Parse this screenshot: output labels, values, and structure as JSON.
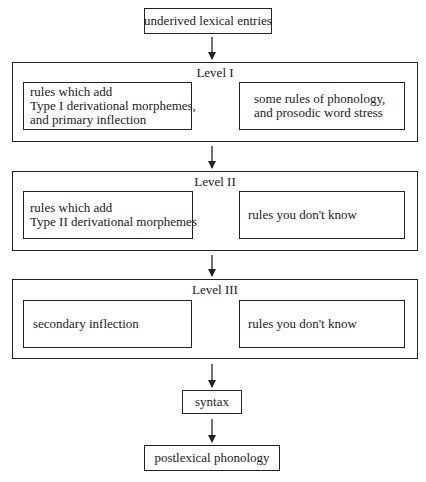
{
  "diagram": {
    "top_box": {
      "label": "underived lexical entries"
    },
    "levels": [
      {
        "title": "Level I",
        "left_box": {
          "lines": [
            "rules which add",
            "Type I derivational morphemes,",
            "and primary inflection"
          ]
        },
        "right_box": {
          "lines": [
            "some rules of phonology,",
            "and prosodic word stress"
          ]
        },
        "bidirectional": true
      },
      {
        "title": "Level II",
        "left_box": {
          "lines": [
            "rules which add",
            "Type  II derivational morphemes"
          ]
        },
        "right_box": {
          "lines": [
            "rules you don't know"
          ]
        },
        "bidirectional": true
      },
      {
        "title": "Level III",
        "left_box": {
          "lines": [
            "secondary inflection"
          ]
        },
        "right_box": {
          "lines": [
            "rules you don't know"
          ]
        },
        "bidirectional": false
      }
    ],
    "syntax_box": {
      "label": "syntax"
    },
    "bottom_box": {
      "label": "postlexical phonology"
    },
    "colors": {
      "line": "#222222",
      "background": "#ffffff"
    }
  }
}
